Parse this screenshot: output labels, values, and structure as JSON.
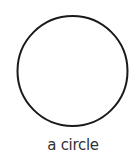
{
  "figure": {
    "shape": "circle",
    "caption": "a circle",
    "stroke_color": "#1a1a1a",
    "fill_color": "#ffffff"
  }
}
